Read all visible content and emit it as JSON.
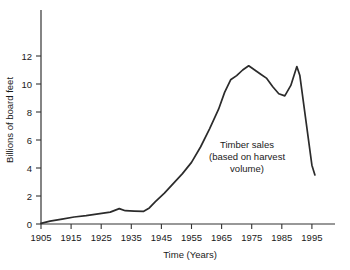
{
  "chart_data": {
    "type": "line",
    "title": "",
    "xlabel": "Time (Years)",
    "ylabel": "Billions of board feet",
    "xlim": [
      1905,
      1997
    ],
    "ylim": [
      0,
      13.5
    ],
    "grid": false,
    "legend": "none",
    "xticks": [
      "1905",
      "1915",
      "1925",
      "1935",
      "1945",
      "1955",
      "1965",
      "1975",
      "1985",
      "1995"
    ],
    "xtick_values": [
      1905,
      1915,
      1925,
      1935,
      1945,
      1955,
      1965,
      1975,
      1985,
      1995
    ],
    "yticks": [
      "0",
      "2",
      "4",
      "6",
      "8",
      "10",
      "12"
    ],
    "ytick_values": [
      0,
      2,
      4,
      6,
      8,
      10,
      12
    ],
    "annotations": [
      {
        "name": "timber-sales-annotation",
        "lines": [
          "Timber sales",
          "(based on harvest",
          "volume)"
        ],
        "x": 1979,
        "y": 5.1
      }
    ],
    "series": [
      {
        "name": "Timber sales (based on harvest volume)",
        "color": "#2b2b2b",
        "x": [
          1905,
          1908,
          1912,
          1916,
          1920,
          1924,
          1928,
          1931,
          1933,
          1936,
          1939,
          1941,
          1943,
          1946,
          1949,
          1952,
          1955,
          1958,
          1961,
          1964,
          1966,
          1968,
          1970,
          1972,
          1974,
          1976,
          1978,
          1980,
          1982,
          1984,
          1986,
          1988,
          1990,
          1991,
          1993,
          1995,
          1996
        ],
        "y": [
          0.05,
          0.2,
          0.35,
          0.5,
          0.6,
          0.72,
          0.85,
          1.1,
          0.95,
          0.92,
          0.9,
          1.15,
          1.6,
          2.2,
          2.9,
          3.6,
          4.4,
          5.5,
          6.8,
          8.2,
          9.4,
          10.3,
          10.6,
          11.0,
          11.3,
          11.0,
          10.7,
          10.4,
          9.8,
          9.3,
          9.15,
          9.9,
          11.25,
          10.6,
          7.4,
          4.2,
          3.5
        ]
      }
    ]
  },
  "axis": {
    "x_title": "Time (Years)",
    "y_title": "Billions of board feet"
  }
}
